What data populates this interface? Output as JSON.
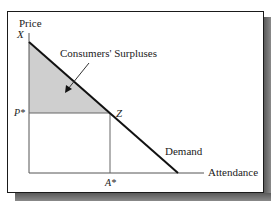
{
  "diagram": {
    "y_axis_label": "Price",
    "x_axis_label": "Attendance",
    "labels": {
      "y_intercept": "X",
      "price_equilibrium": "P*",
      "equilibrium_point": "Z",
      "quantity_equilibrium": "A*",
      "curve": "Demand",
      "shaded_region": "Consumers' Surpluses"
    },
    "colors": {
      "shaded_fill": "#cfcfcf",
      "line": "#111111",
      "axis": "#555555",
      "frame": "#1a1a1a",
      "shadow": "#6a6a6a"
    }
  }
}
